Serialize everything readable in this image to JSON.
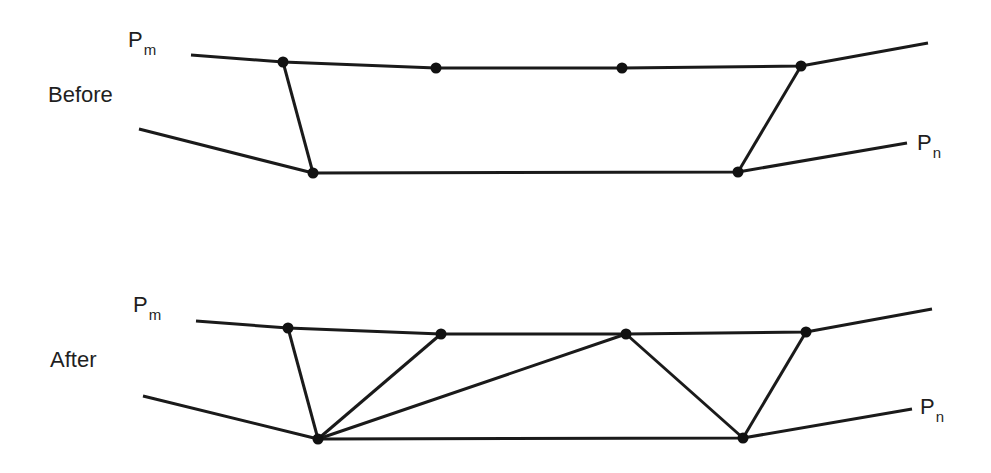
{
  "colors": {
    "background": "#ffffff",
    "stroke": "#1a1a1a",
    "node": "#111111",
    "text": "#1f1f1f"
  },
  "panels": [
    {
      "id": "before",
      "title": "Before",
      "title_pos": [
        48,
        84
      ],
      "label_top": {
        "main": "P",
        "sub": "m",
        "pos": [
          128,
          29
        ]
      },
      "label_bottom": {
        "main": "P",
        "sub": "n",
        "pos": [
          917,
          132
        ]
      },
      "upper_polyline": [
        [
          191,
          55
        ],
        [
          283,
          62
        ],
        [
          436,
          68
        ],
        [
          622,
          68
        ],
        [
          801,
          66
        ],
        [
          928,
          43
        ]
      ],
      "lower_polyline": [
        [
          139,
          129
        ],
        [
          313,
          173
        ],
        [
          738,
          172
        ],
        [
          907,
          143
        ]
      ],
      "nodes": [
        [
          283,
          62
        ],
        [
          436,
          68
        ],
        [
          622,
          68
        ],
        [
          801,
          66
        ],
        [
          313,
          173
        ],
        [
          738,
          172
        ]
      ],
      "connectors": [
        [
          [
            283,
            62
          ],
          [
            313,
            173
          ]
        ],
        [
          [
            801,
            66
          ],
          [
            738,
            172
          ]
        ]
      ]
    },
    {
      "id": "after",
      "title": "After",
      "title_pos": [
        50,
        349
      ],
      "label_top": {
        "main": "P",
        "sub": "m",
        "pos": [
          133,
          294
        ]
      },
      "label_bottom": {
        "main": "P",
        "sub": "n",
        "pos": [
          920,
          396
        ]
      },
      "upper_polyline": [
        [
          196,
          321
        ],
        [
          288,
          328
        ],
        [
          441,
          334
        ],
        [
          626,
          334
        ],
        [
          806,
          332
        ],
        [
          932,
          309
        ]
      ],
      "lower_polyline": [
        [
          143,
          396
        ],
        [
          318,
          439
        ],
        [
          743,
          438
        ],
        [
          912,
          409
        ]
      ],
      "nodes": [
        [
          288,
          328
        ],
        [
          441,
          334
        ],
        [
          626,
          334
        ],
        [
          806,
          332
        ],
        [
          318,
          439
        ],
        [
          743,
          438
        ]
      ],
      "connectors": [
        [
          [
            288,
            328
          ],
          [
            318,
            439
          ]
        ],
        [
          [
            441,
            334
          ],
          [
            318,
            439
          ]
        ],
        [
          [
            626,
            334
          ],
          [
            318,
            439
          ]
        ],
        [
          [
            626,
            334
          ],
          [
            743,
            438
          ]
        ],
        [
          [
            806,
            332
          ],
          [
            743,
            438
          ]
        ]
      ]
    }
  ]
}
